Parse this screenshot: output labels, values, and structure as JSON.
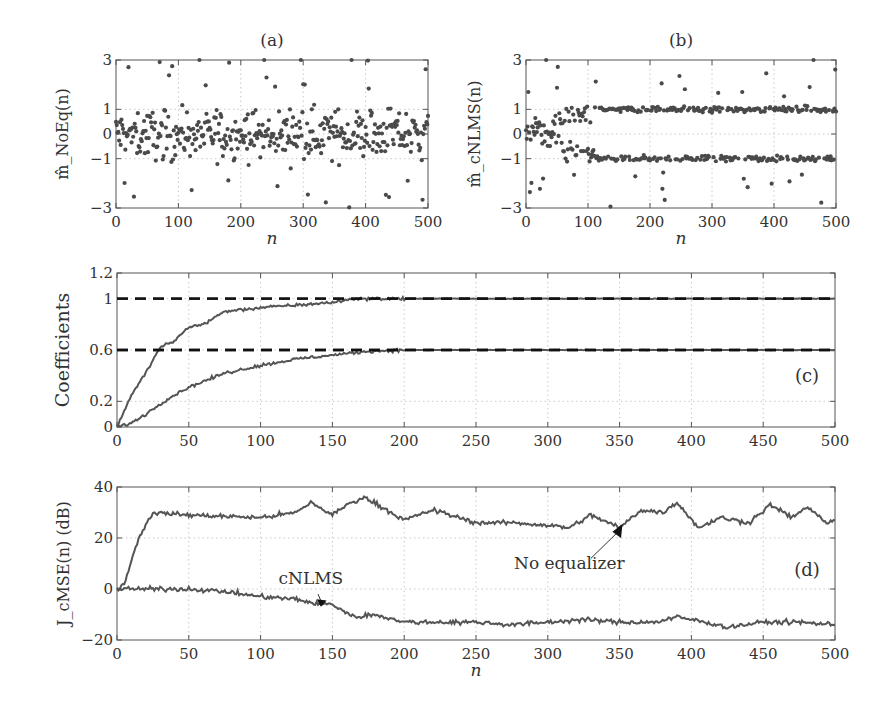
{
  "figure": {
    "panels": [
      "(a)",
      "(b)",
      "(c)",
      "(d)"
    ]
  },
  "chart_data": [
    {
      "id": "a",
      "type": "scatter",
      "title": "(a)",
      "xlabel": "n",
      "ylabel": "m̂_NoEq(n)",
      "xlim": [
        0,
        500
      ],
      "ylim": [
        -3,
        3
      ],
      "xticks": [
        0,
        100,
        200,
        300,
        400,
        500
      ],
      "yticks": [
        -3,
        -1,
        0,
        1,
        3
      ],
      "grid": true,
      "description": "Unequalized symbol estimates scattered uniformly across roughly -3..3 over n=0..500, no clustering"
    },
    {
      "id": "b",
      "type": "scatter",
      "title": "(b)",
      "xlabel": "n",
      "ylabel": "m̂_cNLMS(n)",
      "xlim": [
        0,
        500
      ],
      "ylim": [
        -3,
        3
      ],
      "xticks": [
        0,
        100,
        200,
        300,
        400,
        500
      ],
      "yticks": [
        -3,
        -1,
        0,
        1,
        3
      ],
      "grid": true,
      "description": "cNLMS-equalized estimates start near 0, then separate into two clusters at +1 and -1 after about n=100"
    },
    {
      "id": "c",
      "type": "line",
      "title": "(c)",
      "xlabel": "",
      "ylabel": "Coefficients",
      "xlim": [
        0,
        500
      ],
      "ylim": [
        0,
        1.2
      ],
      "xticks": [
        0,
        50,
        100,
        150,
        200,
        250,
        300,
        350,
        400,
        450,
        500
      ],
      "yticks": [
        0,
        0.2,
        0.6,
        1,
        1.2
      ],
      "grid": true,
      "series": [
        {
          "name": "coefficient 1",
          "x": [
            0,
            10,
            20,
            30,
            40,
            50,
            60,
            75,
            100,
            125,
            150,
            165,
            200,
            500
          ],
          "y": [
            0,
            0.25,
            0.42,
            0.62,
            0.67,
            0.78,
            0.8,
            0.9,
            0.93,
            0.95,
            0.97,
            1.0,
            1.0,
            1.0
          ]
        },
        {
          "name": "coefficient 2",
          "x": [
            0,
            10,
            20,
            30,
            40,
            50,
            75,
            100,
            125,
            150,
            175,
            200,
            250,
            500
          ],
          "y": [
            0,
            0.03,
            0.1,
            0.18,
            0.25,
            0.31,
            0.42,
            0.48,
            0.53,
            0.56,
            0.59,
            0.6,
            0.6,
            0.6
          ]
        },
        {
          "name": "true value 1 (dashed)",
          "x": [
            0,
            500
          ],
          "y": [
            1,
            1
          ]
        },
        {
          "name": "true value 0.6 (dashed)",
          "x": [
            0,
            500
          ],
          "y": [
            0.6,
            0.6
          ]
        }
      ]
    },
    {
      "id": "d",
      "type": "line",
      "title": "(d)",
      "xlabel": "n",
      "ylabel": "J_cMSE(n) (dB)",
      "xlim": [
        0,
        500
      ],
      "ylim": [
        -20,
        40
      ],
      "xticks": [
        0,
        50,
        100,
        150,
        200,
        250,
        300,
        350,
        400,
        450,
        500
      ],
      "yticks": [
        -20,
        0,
        20,
        40
      ],
      "grid": true,
      "annotations": [
        "cNLMS",
        "No equalizer"
      ],
      "series": [
        {
          "name": "No equalizer",
          "x": [
            0,
            5,
            15,
            25,
            50,
            100,
            125,
            135,
            150,
            160,
            172,
            185,
            200,
            220,
            250,
            275,
            300,
            315,
            330,
            350,
            365,
            380,
            390,
            405,
            420,
            440,
            455,
            470,
            480,
            495,
            500
          ],
          "y": [
            0,
            2,
            20,
            30,
            29,
            28,
            30,
            34,
            29,
            33,
            36,
            32,
            27,
            31,
            26,
            26,
            25,
            24,
            29,
            24,
            31,
            30,
            34,
            24,
            28,
            26,
            33,
            28,
            32,
            26,
            27
          ]
        },
        {
          "name": "cNLMS",
          "x": [
            0,
            25,
            50,
            75,
            100,
            125,
            140,
            150,
            165,
            180,
            200,
            225,
            250,
            275,
            300,
            325,
            350,
            375,
            390,
            410,
            425,
            450,
            475,
            500
          ],
          "y": [
            0,
            0,
            0,
            -1,
            -3,
            -4,
            -6,
            -6,
            -11,
            -10,
            -13,
            -13,
            -13,
            -14,
            -13,
            -12,
            -13,
            -13,
            -11,
            -13,
            -15,
            -13,
            -13,
            -14
          ]
        }
      ]
    }
  ]
}
